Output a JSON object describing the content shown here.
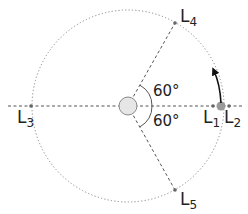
{
  "diagram": {
    "center": {
      "x": 128,
      "y": 106
    },
    "orbit_radius": 96,
    "central_body": {
      "label": "",
      "radius": 9,
      "fill": "#e6e6e6",
      "stroke": "#888888"
    },
    "planet": {
      "x": 221,
      "y": 106,
      "radius": 4.5,
      "fill": "#999999"
    },
    "points": [
      {
        "id": "L1",
        "base": "L",
        "sub": "1",
        "x": 213,
        "y": 106
      },
      {
        "id": "L2",
        "base": "L",
        "sub": "2",
        "x": 229,
        "y": 106
      },
      {
        "id": "L3",
        "base": "L",
        "sub": "3",
        "x": 31,
        "y": 106
      },
      {
        "id": "L4",
        "base": "L",
        "sub": "4",
        "x": 175,
        "y": 23
      },
      {
        "id": "L5",
        "base": "L",
        "sub": "5",
        "x": 175,
        "y": 190
      }
    ],
    "angles": [
      {
        "label": "60°"
      },
      {
        "label": "60°"
      }
    ],
    "colors": {
      "line": "#555555",
      "orbit": "#888888",
      "point": "#666666",
      "arrow": "#111111"
    }
  }
}
